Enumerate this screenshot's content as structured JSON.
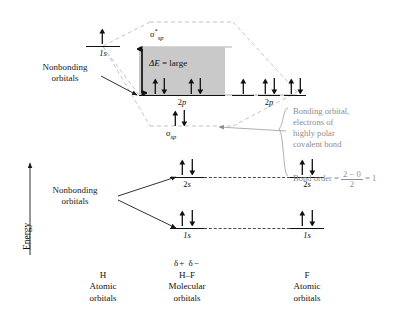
{
  "figure": {
    "type": "molecular-orbital-energy-diagram",
    "molecule": "H-F",
    "axis": {
      "label": "Energy",
      "direction": "up"
    }
  },
  "annotations": {
    "nonbonding_top": "Nonbonding\norbitals",
    "nonbonding_top_line1": "Nonbonding",
    "nonbonding_top_line2": "orbitals",
    "nonbonding_bottom_line1": "Nonbonding",
    "nonbonding_bottom_line2": "orbitals",
    "delta_e": "ΔE = large",
    "delta_e_symbol": "ΔE",
    "delta_e_rest": " = large",
    "bonding_note_line1": "Bonding orbital,",
    "bonding_note_line2": "electrons of",
    "bonding_note_line3": "highly polar",
    "bonding_note_line4": "covalent bond",
    "bond_order_label": "Bond order = ",
    "bond_order_numerator": "2 − 0",
    "bond_order_denominator": "2",
    "bond_order_result": " = 1"
  },
  "columns": [
    {
      "id": "h-atomic",
      "charge": "",
      "species": "H",
      "line2": "Atomic",
      "line3": "orbitals"
    },
    {
      "id": "hf-molecular",
      "charge": "δ+ δ−",
      "species": "H–F",
      "line2": "Molecular",
      "line3": "orbitals"
    },
    {
      "id": "f-atomic",
      "charge": "",
      "species": "F",
      "line2": "Atomic",
      "line3": "orbitals"
    }
  ],
  "orbital_labels": {
    "h_1s": "1s",
    "sigma_star_sp": "σ*sp",
    "sigma_star_base": "σ",
    "sigma_star_sup": "*",
    "sigma_star_sub": "sp",
    "mo_2p": "2p",
    "sigma_sp": "σsp",
    "sigma_base": "σ",
    "sigma_sub": "sp",
    "mo_2s": "2s",
    "mo_1s": "1s",
    "f_2p": "2p",
    "f_2s": "2s",
    "f_1s": "1s"
  },
  "levels": [
    {
      "name": "h-1s-level",
      "label": "1s",
      "column": "h-atomic",
      "electrons": "single-up"
    },
    {
      "name": "sigma-star-level",
      "label": "σ*sp",
      "column": "hf-molecular",
      "electrons": "empty"
    },
    {
      "name": "mo-2p-level",
      "label": "2p",
      "column": "hf-molecular",
      "electrons": "two-pairs"
    },
    {
      "name": "sigma-sp-level",
      "label": "σsp",
      "column": "hf-molecular",
      "electrons": "one-pair"
    },
    {
      "name": "mo-2s-level",
      "label": "2s",
      "column": "hf-molecular",
      "electrons": "one-pair"
    },
    {
      "name": "mo-1s-level",
      "label": "1s",
      "column": "hf-molecular",
      "electrons": "one-pair"
    },
    {
      "name": "f-2p-level",
      "label": "2p",
      "column": "f-atomic",
      "electrons": "single-up-plus-two-pairs"
    },
    {
      "name": "f-2s-level",
      "label": "2s",
      "column": "f-atomic",
      "electrons": "one-pair"
    },
    {
      "name": "f-1s-level",
      "label": "1s",
      "column": "f-atomic",
      "electrons": "one-pair"
    }
  ],
  "colors": {
    "ink": "#1a1a1a",
    "gray_text": "#8d8d8d",
    "shade_box": "#c9c9c9",
    "dash_gray": "#b9b9b9",
    "level_black": "#111111"
  }
}
